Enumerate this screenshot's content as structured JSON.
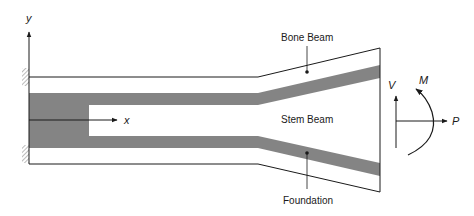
{
  "diagram": {
    "type": "beam-schematic",
    "labels": {
      "y_axis": "y",
      "x_axis": "x",
      "bone_beam": "Bone Beam",
      "stem_beam": "Stem Beam",
      "foundation": "Foundation",
      "shear": "V",
      "moment": "M",
      "axial": "P"
    },
    "colors": {
      "line": "#1a1a1a",
      "shaded_band": "#7a7a7a",
      "background": "#ffffff"
    }
  }
}
